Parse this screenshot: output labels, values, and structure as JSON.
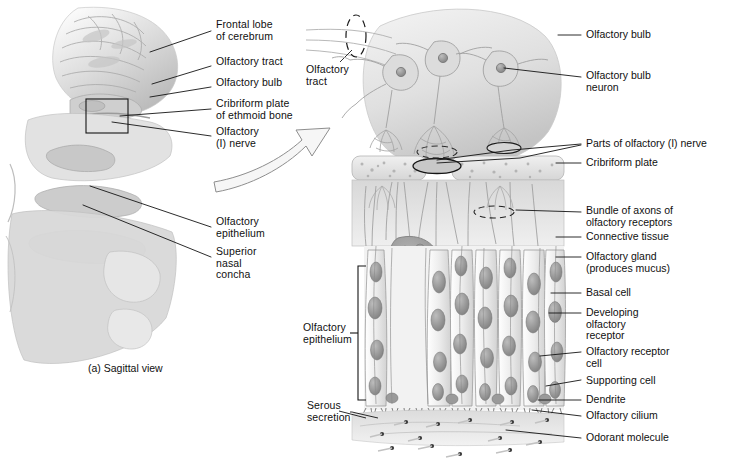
{
  "figure": {
    "caption_a": "(a) Sagittal view",
    "panel_a_name": "sagittal-head-view",
    "panel_b_name": "olfactory-epithelium-detail"
  },
  "colors": {
    "ink": "#101010",
    "leader": "#1a1a1a",
    "tissue_light": "#e9e9e9",
    "tissue_mid": "#cfcfcf",
    "tissue_dark": "#9a9a9a",
    "nucleus": "#8f8f8f",
    "bone": "#dedede",
    "background": "#ffffff"
  },
  "left_labels": [
    {
      "id": "frontal-lobe",
      "lines": [
        "Frontal lobe",
        "of cerebrum"
      ],
      "x": 216,
      "y": 25,
      "leader": [
        211,
        31,
        150,
        52
      ]
    },
    {
      "id": "olfactory-tract",
      "lines": [
        "Olfactory tract"
      ],
      "x": 216,
      "y": 62,
      "leader": [
        211,
        66,
        152,
        84
      ]
    },
    {
      "id": "olfactory-bulb",
      "lines": [
        "Olfactory bulb"
      ],
      "x": 216,
      "y": 83,
      "leader": [
        211,
        87,
        150,
        97
      ]
    },
    {
      "id": "cribriform-plate",
      "lines": [
        "Cribriform plate",
        "of ethmoid bone"
      ],
      "x": 216,
      "y": 104,
      "leader": [
        211,
        109,
        120,
        116
      ]
    },
    {
      "id": "olfactory-nerve",
      "lines": [
        "Olfactory",
        "(I) nerve"
      ],
      "x": 216,
      "y": 132,
      "leader": [
        211,
        136,
        112,
        122
      ]
    },
    {
      "id": "olfactory-epithelium-left",
      "lines": [
        "Olfactory",
        "epithelium"
      ],
      "x": 216,
      "y": 222,
      "leader": [
        211,
        227,
        90,
        186
      ]
    },
    {
      "id": "superior-nasal-concha",
      "lines": [
        "Superior",
        "nasal",
        "concha"
      ],
      "x": 216,
      "y": 252,
      "leader": [
        211,
        257,
        83,
        205
      ]
    }
  ],
  "mid_labels": [
    {
      "id": "olfactory-tract-b",
      "lines": [
        "Olfactory",
        "tract"
      ],
      "x": 306,
      "y": 70
    },
    {
      "id": "olfactory-epithelium-bracket",
      "lines": [
        "Olfactory",
        "epithelium"
      ],
      "x": 303,
      "y": 328
    },
    {
      "id": "serous-secretion",
      "lines": [
        "Serous",
        "secretion"
      ],
      "x": 307,
      "y": 406
    }
  ],
  "right_labels": [
    {
      "id": "olfactory-bulb-r",
      "lines": [
        "Olfactory bulb"
      ],
      "x": 586,
      "y": 30,
      "leader": [
        558,
        35,
        581,
        35
      ]
    },
    {
      "id": "olfactory-bulb-neuron",
      "lines": [
        "Olfactory bulb",
        "neuron"
      ],
      "x": 586,
      "y": 71,
      "leader": [
        495,
        77,
        581,
        77
      ]
    },
    {
      "id": "parts-of-olfactory-nerve",
      "lines": [
        "Parts of olfactory (I) nerve"
      ],
      "x": 586,
      "y": 139,
      "leader": [
        437,
        160,
        581,
        144
      ]
    },
    {
      "id": "cribriform-plate-r",
      "lines": [
        "Cribriform plate"
      ],
      "x": 586,
      "y": 158,
      "leader": [
        556,
        163,
        581,
        163
      ]
    },
    {
      "id": "bundle-of-axons",
      "lines": [
        "Bundle of axons of",
        "olfactory receptors"
      ],
      "x": 586,
      "y": 207,
      "leader": [
        519,
        212,
        581,
        212
      ]
    },
    {
      "id": "connective-tissue",
      "lines": [
        "Connective tissue"
      ],
      "x": 586,
      "y": 232,
      "leader": [
        556,
        237,
        581,
        237
      ]
    },
    {
      "id": "olfactory-gland",
      "lines": [
        "Olfactory gland",
        "(produces mucus)"
      ],
      "x": 586,
      "y": 252,
      "leader": [
        556,
        257,
        581,
        257
      ]
    },
    {
      "id": "basal-cell",
      "lines": [
        "Basal cell"
      ],
      "x": 586,
      "y": 288,
      "leader": [
        552,
        293,
        581,
        293
      ]
    },
    {
      "id": "developing-receptor",
      "lines": [
        "Developing",
        "olfactory",
        "receptor"
      ],
      "x": 586,
      "y": 308,
      "leader": [
        552,
        313,
        581,
        313
      ]
    },
    {
      "id": "olfactory-receptor-cell",
      "lines": [
        "Olfactory receptor",
        "cell"
      ],
      "x": 586,
      "y": 347,
      "leader": [
        545,
        352,
        581,
        352
      ]
    },
    {
      "id": "supporting-cell",
      "lines": [
        "Supporting cell"
      ],
      "x": 586,
      "y": 377,
      "leader": [
        548,
        384,
        581,
        380
      ]
    },
    {
      "id": "dendrite",
      "lines": [
        "Dendrite"
      ],
      "x": 586,
      "y": 397,
      "leader": [
        540,
        398,
        581,
        400
      ]
    },
    {
      "id": "olfactory-cilium",
      "lines": [
        "Olfactory cilium"
      ],
      "x": 586,
      "y": 413,
      "leader": [
        536,
        410,
        581,
        416
      ]
    },
    {
      "id": "odorant-molecule",
      "lines": [
        "Odorant molecule"
      ],
      "x": 586,
      "y": 435,
      "leader": [
        506,
        432,
        581,
        438
      ]
    }
  ],
  "structures": {
    "highlight_box": {
      "x": 86,
      "y": 99,
      "w": 42,
      "h": 34
    },
    "bracket": {
      "x": 360,
      "y": 266,
      "h": 134
    },
    "arrow_label": "zoom-arrow"
  }
}
